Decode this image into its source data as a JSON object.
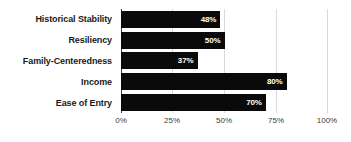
{
  "chart_data": {
    "type": "bar",
    "orientation": "horizontal",
    "title": "",
    "xlabel": "",
    "ylabel": "",
    "categories": [
      "Historical Stability",
      "Resiliency",
      "Family-Centeredness",
      "Income",
      "Ease of Entry"
    ],
    "values": [
      48,
      50,
      37,
      80,
      70
    ],
    "value_labels": [
      "48%",
      "50%",
      "37%",
      "80%",
      "70%"
    ],
    "xlim": [
      0,
      100
    ],
    "xticks": [
      0,
      25,
      50,
      75,
      100
    ],
    "xtick_labels": [
      "0%",
      "25%",
      "50%",
      "75%",
      "100%"
    ],
    "grid": true,
    "legend": "none",
    "bar_color": "#0a0a0a",
    "value_label_color": "#ffffff",
    "gridline_color": "#d9d9d9",
    "axis_color": "#3d3d3d",
    "background_color": "#ffffff"
  }
}
